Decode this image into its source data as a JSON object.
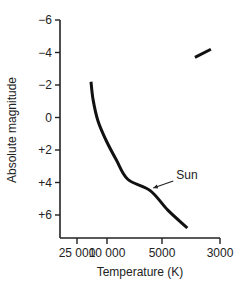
{
  "chart_data": {
    "type": "line",
    "title": "",
    "xlabel": "Temperature (K)",
    "ylabel": "Absolute magnitude",
    "x_scale": "nonlinear (decreasing temperature to the right)",
    "x_ticks": [
      25000,
      10000,
      5000,
      3000
    ],
    "x_tick_labels": [
      "25 000",
      "10 000",
      "5000",
      "3000"
    ],
    "y_ticks": [
      -6,
      -4,
      -2,
      0,
      2,
      4,
      6
    ],
    "y_tick_labels": [
      "−6",
      "−4",
      "−2",
      "0",
      "+2",
      "+4",
      "+6"
    ],
    "y_inverted": true,
    "ylim": [
      -6.3,
      7.3
    ],
    "grid": false,
    "series": [
      {
        "name": "Main sequence",
        "points": [
          {
            "T": 16300,
            "M": -2.2
          },
          {
            "T": 15300,
            "M": -1.1
          },
          {
            "T": 13200,
            "M": 0.2
          },
          {
            "T": 10300,
            "M": 1.4
          },
          {
            "T": 8900,
            "M": 2.6
          },
          {
            "T": 7700,
            "M": 3.8
          },
          {
            "T": 5800,
            "M": 4.5
          },
          {
            "T": 4750,
            "M": 5.7
          },
          {
            "T": 4000,
            "M": 6.8
          }
        ]
      },
      {
        "name": "Giant branch",
        "points": [
          {
            "T": 3740,
            "M": -3.7
          },
          {
            "T": 3250,
            "M": -4.2
          }
        ]
      }
    ],
    "annotations": [
      {
        "text": "Sun",
        "T": 5800,
        "M": 4.4,
        "arrow": true
      }
    ]
  },
  "header_fragment": "…"
}
